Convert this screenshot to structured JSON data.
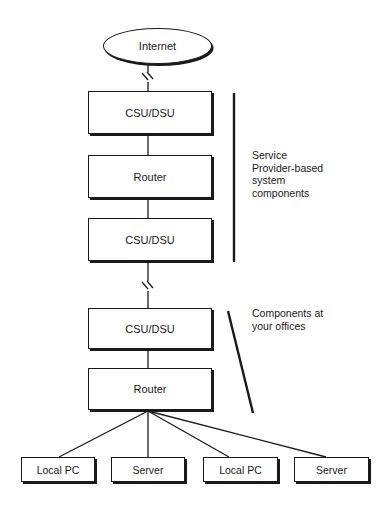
{
  "diagram": {
    "internet": {
      "label": "Internet"
    },
    "provider_stack": [
      {
        "id": "csu-dsu-1",
        "label": "CSU/DSU"
      },
      {
        "id": "router-1",
        "label": "Router"
      },
      {
        "id": "csu-dsu-2",
        "label": "CSU/DSU"
      }
    ],
    "office_stack": [
      {
        "id": "csu-dsu-3",
        "label": "CSU/DSU"
      },
      {
        "id": "router-2",
        "label": "Router"
      }
    ],
    "endpoints": [
      {
        "id": "local-pc-1",
        "label": "Local PC"
      },
      {
        "id": "server-1",
        "label": "Server"
      },
      {
        "id": "local-pc-2",
        "label": "Local PC"
      },
      {
        "id": "server-2",
        "label": "Server"
      }
    ],
    "annotations": {
      "provider": "Service\nProvider-based\nsystem\ncomponents",
      "office": "Components at\nyour offices"
    },
    "colors": {
      "stroke": "#1a1a1a",
      "fill": "#ffffff"
    }
  }
}
